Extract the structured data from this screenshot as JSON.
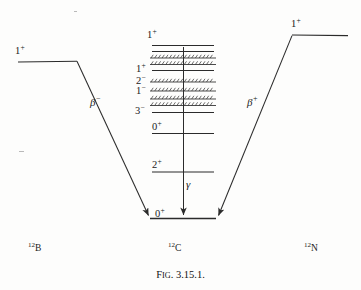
{
  "figure": {
    "caption_prefix": "F",
    "caption_smallcaps": "IG",
    "caption_number": ". 3.15.1.",
    "caption_full": "FIG. 3.15.1."
  },
  "colors": {
    "ink": "#1a1a1a",
    "line": "#2b2b2b",
    "background": "#fdfdfc"
  },
  "nuclides": {
    "left": {
      "mass": "12",
      "symbol": "B",
      "name": "boron-12"
    },
    "center": {
      "mass": "12",
      "symbol": "C",
      "name": "carbon-12"
    },
    "right": {
      "mass": "12",
      "symbol": "N",
      "name": "nitrogen-12"
    }
  },
  "decays": {
    "left": {
      "label": "β",
      "charge": "−",
      "full": "β−",
      "from": "12B",
      "to": "12C"
    },
    "right": {
      "label": "β",
      "charge": "+",
      "full": "β+",
      "from": "12N",
      "to": "12C"
    },
    "gamma": {
      "label": "γ",
      "full": "γ",
      "from": "2+",
      "to": "0+"
    }
  },
  "parent_levels": {
    "left": {
      "spin": "1",
      "parity": "+",
      "full": "1+"
    },
    "right": {
      "spin": "1",
      "parity": "+",
      "full": "1+"
    }
  },
  "center_levels": [
    {
      "spin": "1",
      "parity": "+",
      "full": "1+",
      "kind": "solid",
      "labeled": true
    },
    {
      "spin": "",
      "parity": "",
      "full": "",
      "kind": "solid",
      "labeled": false
    },
    {
      "spin": "",
      "parity": "",
      "full": "",
      "kind": "hatched",
      "labeled": false
    },
    {
      "spin": "",
      "parity": "",
      "full": "",
      "kind": "hatched",
      "labeled": false
    },
    {
      "spin": "1",
      "parity": "+",
      "full": "1+",
      "kind": "solid",
      "labeled": true
    },
    {
      "spin": "2",
      "parity": "−",
      "full": "2−",
      "kind": "hatched",
      "labeled": true
    },
    {
      "spin": "1",
      "parity": "−",
      "full": "1−",
      "kind": "hatched",
      "labeled": true
    },
    {
      "spin": "",
      "parity": "",
      "full": "",
      "kind": "hatched",
      "labeled": false
    },
    {
      "spin": "",
      "parity": "",
      "full": "",
      "kind": "hatched",
      "labeled": false
    },
    {
      "spin": "3",
      "parity": "−",
      "full": "3−",
      "kind": "solid",
      "labeled": true
    },
    {
      "spin": "0",
      "parity": "+",
      "full": "0+",
      "kind": "solid",
      "labeled": true
    },
    {
      "spin": "2",
      "parity": "+",
      "full": "2+",
      "kind": "solid",
      "labeled": true
    },
    {
      "spin": "0",
      "parity": "+",
      "full": "0+",
      "kind": "ground",
      "labeled": true
    }
  ]
}
